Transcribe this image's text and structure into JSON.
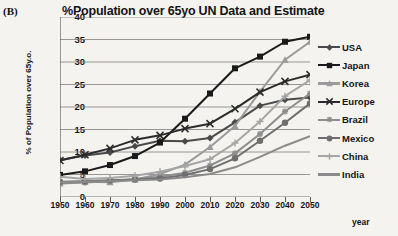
{
  "panel": {
    "label": "(B)"
  },
  "axis": {
    "ylabel": "% of Population over 65y.o.",
    "xlabel": "year",
    "yticks": [
      "0",
      "5",
      "10",
      "15",
      "20",
      "25",
      "30",
      "35",
      "40"
    ],
    "xticks": [
      "1950",
      "1960",
      "1970",
      "1980",
      "1990",
      "2000",
      "2010",
      "2020",
      "2030",
      "2040",
      "2050"
    ]
  },
  "legend": [
    {
      "label": "USA",
      "color": "#4a4a4a",
      "marker": "diamond"
    },
    {
      "label": "Japan",
      "color": "#1a1a1a",
      "marker": "square"
    },
    {
      "label": "Korea",
      "color": "#9a9a9a",
      "marker": "triangle"
    },
    {
      "label": "Europe",
      "color": "#2b2b2b",
      "marker": "x"
    },
    {
      "label": "Brazil",
      "color": "#8e8e8e",
      "marker": "asterisk"
    },
    {
      "label": "Mexico",
      "color": "#6e6e6e",
      "marker": "circle"
    },
    {
      "label": "China",
      "color": "#a5a5a5",
      "marker": "plus"
    },
    {
      "label": "India",
      "color": "#8a8a8a",
      "marker": "none"
    }
  ],
  "chart_data": {
    "type": "line",
    "title": "%Population over 65yo UN Data and Estimate",
    "xlabel": "year",
    "ylabel": "% of Population over 65y.o.",
    "x": [
      1950,
      1960,
      1970,
      1980,
      1990,
      2000,
      2010,
      2020,
      2030,
      2040,
      2050
    ],
    "xlim": [
      1950,
      2050
    ],
    "ylim": [
      0,
      40
    ],
    "ytick_step": 5,
    "grid": "horizontal",
    "legend_position": "right",
    "series": [
      {
        "name": "USA",
        "color": "#4a4a4a",
        "marker": "diamond",
        "values": [
          8.2,
          9.2,
          9.9,
          11.3,
          12.5,
          12.4,
          13.1,
          16.6,
          20.3,
          21.6,
          22.1
        ]
      },
      {
        "name": "Japan",
        "color": "#1a1a1a",
        "marker": "square",
        "values": [
          4.9,
          5.7,
          7.1,
          9.1,
          12.1,
          17.4,
          23.0,
          28.6,
          31.2,
          34.5,
          35.6
        ]
      },
      {
        "name": "Korea",
        "color": "#9a9a9a",
        "marker": "triangle",
        "values": [
          3.0,
          3.4,
          3.3,
          3.9,
          5.1,
          7.2,
          11.1,
          15.8,
          23.4,
          30.5,
          34.5
        ]
      },
      {
        "name": "Europe",
        "color": "#2b2b2b",
        "marker": "x",
        "values": [
          8.1,
          9.4,
          10.8,
          12.7,
          13.7,
          15.2,
          16.3,
          19.6,
          23.3,
          25.7,
          27.2
        ]
      },
      {
        "name": "Brazil",
        "color": "#8e8e8e",
        "marker": "asterisk",
        "values": [
          3.0,
          3.2,
          3.5,
          4.0,
          4.5,
          5.4,
          7.0,
          9.7,
          14.0,
          19.0,
          23.0
        ]
      },
      {
        "name": "Mexico",
        "color": "#6e6e6e",
        "marker": "circle",
        "values": [
          3.4,
          3.5,
          3.7,
          3.9,
          4.1,
          4.9,
          6.2,
          8.6,
          12.5,
          16.5,
          20.8
        ]
      },
      {
        "name": "China",
        "color": "#a5a5a5",
        "marker": "plus",
        "values": [
          4.5,
          4.0,
          4.2,
          4.7,
          5.6,
          6.9,
          8.4,
          12.0,
          16.8,
          22.4,
          26.0
        ]
      },
      {
        "name": "India",
        "color": "#8a8a8a",
        "marker": "none",
        "values": [
          3.3,
          3.4,
          3.5,
          3.7,
          3.9,
          4.4,
          5.1,
          6.6,
          8.9,
          11.4,
          13.5
        ]
      }
    ]
  }
}
